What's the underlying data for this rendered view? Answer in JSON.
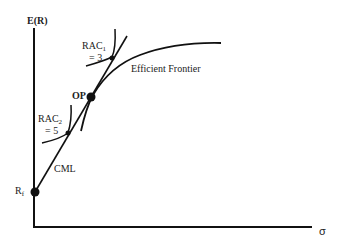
{
  "diagram": {
    "y_axis_label": "E(R)",
    "x_axis_label": "σ",
    "labels": {
      "rac1_main": "RAC",
      "rac1_sub": "1",
      "rac1_value": "= 3",
      "rac2_main": "RAC",
      "rac2_sub": "2",
      "rac2_value": "= 5",
      "op": "OP",
      "efficient_frontier": "Efficient Frontier",
      "cml": "CML",
      "rf_main": "R",
      "rf_sub": "f"
    },
    "colors": {
      "line": "#111111",
      "text": "#222222",
      "background": "#ffffff"
    }
  }
}
